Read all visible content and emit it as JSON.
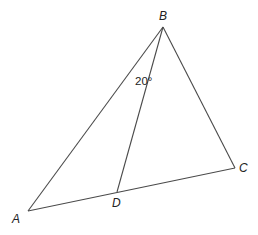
{
  "diagram": {
    "type": "triangle",
    "points": {
      "A": {
        "label": "A",
        "x": 28,
        "y": 211
      },
      "B": {
        "label": "B",
        "x": 163,
        "y": 27
      },
      "C": {
        "label": "C",
        "x": 235,
        "y": 168
      },
      "D": {
        "label": "D",
        "x": 117,
        "y": 192
      }
    },
    "segments": [
      {
        "from": "A",
        "to": "B"
      },
      {
        "from": "B",
        "to": "C"
      },
      {
        "from": "A",
        "to": "C"
      },
      {
        "from": "B",
        "to": "D"
      }
    ],
    "angle_label": {
      "text": "20°",
      "at": "B",
      "between": [
        "A",
        "D"
      ]
    },
    "colors": {
      "line": "#4a4a4a",
      "text": "#222222",
      "background": "#ffffff"
    }
  }
}
